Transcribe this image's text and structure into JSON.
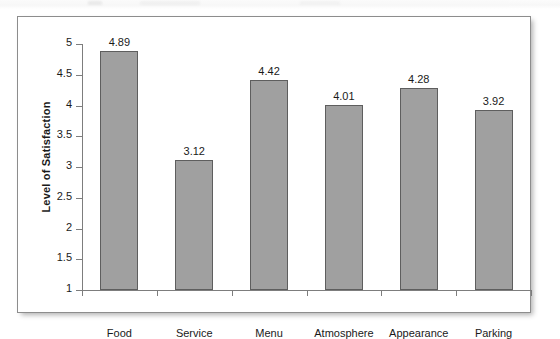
{
  "figure": {
    "frame_border_color": "#8d8d8d",
    "background": "#ffffff"
  },
  "chart_data": {
    "type": "bar",
    "title": "",
    "xlabel": "",
    "ylabel": "Level of Satisfaction",
    "categories": [
      "Food",
      "Service",
      "Menu",
      "Atmosphere",
      "Appearance",
      "Parking"
    ],
    "values": [
      4.89,
      3.12,
      4.42,
      4.01,
      4.28,
      3.92
    ],
    "value_labels": [
      "4.89",
      "3.12",
      "4.42",
      "4.01",
      "4.28",
      "3.92"
    ],
    "ylim": [
      1,
      5
    ],
    "ytick_values": [
      1,
      1.5,
      2,
      2.5,
      3,
      3.5,
      4,
      4.5,
      5
    ],
    "ytick_labels": [
      "1",
      "1.5",
      "2",
      "2.5",
      "3",
      "3.5",
      "4",
      "4.5",
      "5"
    ],
    "grid": false,
    "legend": null,
    "bar_color": "#a0a0a0",
    "bar_border_color": "#5e5e5e",
    "axis_color": "#7d7d7d"
  }
}
